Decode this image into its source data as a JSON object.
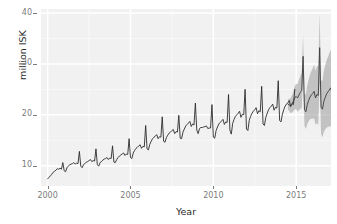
{
  "chart_data": {
    "type": "line",
    "title": "",
    "xlabel": "Year",
    "ylabel": "million ISK",
    "xlim": [
      1999.6,
      2017.1
    ],
    "ylim": [
      6.0,
      40.8
    ],
    "grid": true,
    "legend": null,
    "x_ticks": [
      2000,
      2005,
      2010,
      2015
    ],
    "x_tick_labels": [
      "2000",
      "2005",
      "2010",
      "2015"
    ],
    "y_ticks": [
      10,
      20,
      30,
      40
    ],
    "y_tick_labels": [
      "10",
      "20",
      "30",
      "40"
    ],
    "x_minor_ticks": [
      2002.5,
      2007.5,
      2012.5
    ],
    "y_minor_ticks": [
      15,
      25,
      35
    ],
    "series": [
      {
        "name": "observed",
        "color": "#2b2b2b",
        "x_start": 2000.0,
        "x_step": 0.08333,
        "values": [
          7.4,
          7.7,
          8.0,
          8.3,
          8.7,
          8.9,
          9.1,
          9.4,
          9.3,
          9.5,
          9.3,
          10.6,
          9.0,
          8.8,
          9.6,
          9.9,
          10.2,
          10.3,
          10.4,
          10.6,
          10.3,
          10.5,
          10.4,
          12.8,
          9.9,
          9.6,
          10.2,
          10.4,
          10.7,
          10.8,
          11.0,
          11.2,
          10.8,
          11.0,
          10.9,
          13.3,
          10.2,
          9.9,
          10.6,
          10.8,
          11.1,
          11.3,
          11.4,
          11.6,
          11.2,
          11.5,
          11.4,
          13.9,
          10.7,
          10.6,
          11.2,
          11.6,
          11.9,
          12.1,
          12.3,
          12.5,
          12.0,
          12.3,
          12.2,
          15.3,
          11.6,
          11.4,
          12.5,
          13.0,
          13.4,
          13.6,
          13.9,
          14.1,
          13.4,
          13.8,
          13.7,
          17.9,
          13.3,
          13.1,
          14.2,
          14.8,
          15.3,
          15.6,
          15.8,
          16.1,
          15.3,
          15.7,
          15.6,
          19.6,
          14.8,
          14.6,
          15.5,
          16.0,
          16.4,
          16.6,
          16.9,
          17.1,
          16.3,
          16.7,
          16.6,
          19.9,
          15.4,
          15.3,
          16.6,
          17.2,
          17.8,
          18.1,
          18.4,
          18.7,
          17.7,
          18.2,
          18.0,
          22.3,
          17.0,
          16.3,
          17.3,
          17.5,
          17.5,
          17.6,
          17.7,
          17.8,
          17.3,
          17.4,
          17.4,
          22.0,
          15.6,
          15.4,
          16.9,
          17.6,
          18.2,
          18.5,
          18.8,
          19.1,
          18.1,
          18.6,
          18.5,
          24.0,
          17.0,
          16.2,
          18.3,
          19.1,
          19.7,
          20.0,
          20.3,
          20.7,
          19.5,
          20.1,
          20.0,
          25.0,
          17.2,
          16.9,
          18.9,
          19.7,
          20.3,
          20.7,
          21.0,
          21.4,
          20.2,
          20.8,
          20.6,
          25.6,
          18.2,
          17.9,
          19.5,
          20.3,
          21.0,
          21.4,
          21.7,
          22.1,
          20.9,
          21.5,
          21.3,
          26.7,
          18.9,
          18.6,
          20.1,
          21.0,
          21.7,
          22.1,
          22.4,
          22.8,
          21.6,
          22.2,
          22.0,
          25.0
        ]
      },
      {
        "name": "forecast",
        "color": "#3b3b3b",
        "x_start": 2014.5,
        "x_step": 0.08333,
        "values": [
          22.1,
          21.9,
          21.8,
          22.2,
          22.7,
          23.4,
          23.6,
          23.3,
          23.9,
          24.4,
          24.8,
          31.5,
          21.0,
          20.6,
          22.0,
          22.8,
          23.5,
          23.9,
          24.2,
          24.6,
          23.3,
          24.0,
          23.8,
          33.2,
          21.5,
          21.1,
          22.6,
          23.4,
          24.1,
          24.5,
          24.9,
          25.3,
          24.0,
          24.7,
          24.5,
          37.5,
          22.0,
          21.6,
          23.2,
          24.0,
          24.8,
          25.2,
          25.6,
          26.0,
          24.7,
          25.4,
          27.9
        ],
        "interval": {
          "fill": "#9a9a9a",
          "opacity": 0.55,
          "lower": [
            21.1,
            20.7,
            20.3,
            20.5,
            20.7,
            21.1,
            21.1,
            20.6,
            20.9,
            21.2,
            21.3,
            27.3,
            17.8,
            17.2,
            18.2,
            18.7,
            19.1,
            19.2,
            19.2,
            19.3,
            18.0,
            18.4,
            18.0,
            26.4,
            16.2,
            15.6,
            16.6,
            17.1,
            17.5,
            17.6,
            17.7,
            17.8,
            16.5,
            16.9,
            16.5,
            28.0,
            15.3,
            14.7,
            15.8,
            16.3,
            16.8,
            16.9,
            17.0,
            17.2,
            15.8,
            16.3,
            18.3
          ],
          "upper": [
            23.1,
            23.1,
            23.3,
            23.9,
            24.7,
            25.7,
            26.1,
            26.0,
            26.9,
            27.6,
            28.3,
            35.7,
            24.2,
            24.0,
            25.8,
            26.9,
            27.9,
            28.6,
            29.2,
            29.9,
            28.6,
            29.6,
            29.6,
            40.0,
            26.8,
            26.6,
            28.6,
            29.7,
            30.7,
            31.4,
            32.1,
            32.8,
            31.5,
            32.5,
            32.5,
            47.0,
            28.7,
            28.5,
            30.6,
            31.7,
            32.8,
            33.5,
            34.2,
            34.8,
            33.6,
            34.5,
            37.5
          ]
        }
      }
    ]
  },
  "panel": {
    "background": "#f1f1f1",
    "gridline_major_color": "#ffffff",
    "gridline_minor_color": "#fafafa",
    "tick_color": "#7b7b7b",
    "axis_text_color": "#7b7b7b",
    "axis_title_color": "#2b2b2b"
  }
}
